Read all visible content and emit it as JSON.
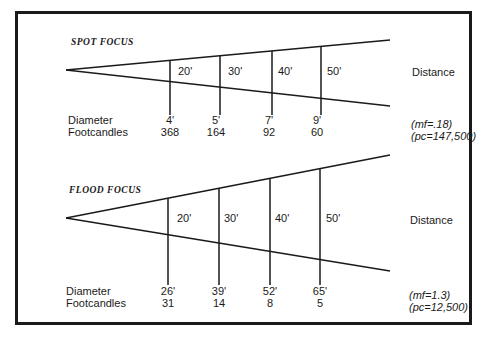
{
  "spot": {
    "title": "SPOT FOCUS",
    "distance_label": "Distance",
    "row_labels": {
      "diameter": "Diameter",
      "footcandles": "Footcandles"
    },
    "distances": [
      "20'",
      "30'",
      "40'",
      "50'"
    ],
    "diameters": [
      "4'",
      "5'",
      "7'",
      "9'"
    ],
    "footcandles": [
      "368",
      "164",
      "92",
      "60"
    ],
    "mf": "(mf=.18)",
    "pc": "(pc=147,500)"
  },
  "flood": {
    "title": "FLOOD FOCUS",
    "distance_label": "Distance",
    "row_labels": {
      "diameter": "Diameter",
      "footcandles": "Footcandles"
    },
    "distances": [
      "20'",
      "30'",
      "40'",
      "50'"
    ],
    "diameters": [
      "26'",
      "39'",
      "52'",
      "65'"
    ],
    "footcandles": [
      "31",
      "14",
      "8",
      "5"
    ],
    "mf": "(mf=1.3)",
    "pc": "(pc=12,500)"
  }
}
